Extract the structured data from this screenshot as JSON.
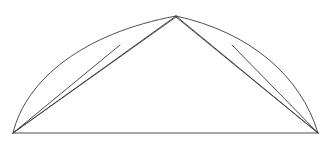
{
  "page": {
    "background_color": "#ffffff",
    "width": 332,
    "height": 145
  },
  "header": {
    "clipped_text": "— — —— — —— — ——— — — —— —— —",
    "text_color": "#c9c9cf",
    "note": "illegible faint line of text cut off at the top edge"
  },
  "figure": {
    "title": "",
    "stroke_color": "#3a3a3a",
    "stroke_width": 0.9,
    "fill": "none",
    "points": {
      "base_left": {
        "label": "A",
        "x": 13,
        "y": 133
      },
      "base_right": {
        "label": "B",
        "x": 318,
        "y": 133
      },
      "apex": {
        "label": "C",
        "x": 176,
        "y": 16
      }
    },
    "elements": [
      {
        "name": "baseline",
        "kind": "line",
        "from": "base_left",
        "to": "base_right",
        "d": "M 13 133 L 318 133"
      },
      {
        "name": "outer-arc-left",
        "kind": "arc",
        "from": "base_left",
        "to": "apex",
        "d": "M 13 133 C 26 79 84 33 176 16"
      },
      {
        "name": "outer-arc-right",
        "kind": "arc",
        "from": "apex",
        "to": "base_right",
        "d": "M 176 16 C 250 32 301 76 318 133"
      },
      {
        "name": "inner-chord-left",
        "kind": "line",
        "from": "base_left",
        "to": "apex",
        "d": "M 13 133 L 176 16"
      },
      {
        "name": "inner-chord-right",
        "kind": "line",
        "from": "apex",
        "to": "base_right",
        "d": "M 176 16 L 318 133"
      },
      {
        "name": "mid-chord-left",
        "kind": "line",
        "from": "base_left",
        "to": "apex",
        "d": "M 13 133 L 176 17"
      },
      {
        "name": "mid-chord-right",
        "kind": "line",
        "from": "apex",
        "to": "base_right",
        "d": "M 176 17 L 318 133"
      },
      {
        "name": "secant-left",
        "kind": "line",
        "from": "base_left",
        "to": "arc-upper-left",
        "d": "M 13 133 L 120 45"
      },
      {
        "name": "secant-right",
        "kind": "line",
        "from": "arc-upper-right",
        "to": "base_right",
        "d": "M 232 45 L 318 133"
      }
    ]
  }
}
